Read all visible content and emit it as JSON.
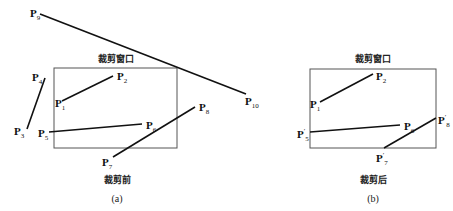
{
  "panels": [
    {
      "id": "a",
      "window_label": "裁剪窗口",
      "state_label": "裁剪前",
      "caption": "(a)",
      "window": {
        "x1": 54,
        "y1": 68,
        "x2": 177,
        "y2": 148
      },
      "segments": [
        {
          "from": "P1",
          "to": "P2",
          "x1": 62,
          "y1": 101,
          "x2": 113,
          "y2": 76
        },
        {
          "from": "P3",
          "to": "P4",
          "x1": 27,
          "y1": 129,
          "x2": 45,
          "y2": 78
        },
        {
          "from": "P5",
          "to": "P6",
          "x1": 49,
          "y1": 132,
          "x2": 142,
          "y2": 124
        },
        {
          "from": "P7",
          "to": "P8",
          "x1": 113,
          "y1": 157,
          "x2": 195,
          "y2": 107
        },
        {
          "from": "P9",
          "to": "P10",
          "x1": 40,
          "y1": 14,
          "x2": 246,
          "y2": 94
        }
      ],
      "points": [
        {
          "base": "P",
          "sub": "1",
          "prime": "",
          "x": 55,
          "y": 98
        },
        {
          "base": "P",
          "sub": "2",
          "prime": "",
          "x": 117,
          "y": 71
        },
        {
          "base": "P",
          "sub": "3",
          "prime": "",
          "x": 14,
          "y": 126
        },
        {
          "base": "P",
          "sub": "4",
          "prime": "",
          "x": 32,
          "y": 72
        },
        {
          "base": "P",
          "sub": "5",
          "prime": "",
          "x": 38,
          "y": 128
        },
        {
          "base": "P",
          "sub": "6",
          "prime": "",
          "x": 146,
          "y": 120
        },
        {
          "base": "P",
          "sub": "7",
          "prime": "",
          "x": 102,
          "y": 157
        },
        {
          "base": "P",
          "sub": "8",
          "prime": "",
          "x": 199,
          "y": 102
        },
        {
          "base": "P",
          "sub": "9",
          "prime": "",
          "x": 30,
          "y": 8
        },
        {
          "base": "P",
          "sub": "10",
          "prime": "",
          "x": 245,
          "y": 96
        }
      ],
      "window_label_pos": {
        "x": 116,
        "y": 52
      },
      "state_label_pos": {
        "x": 117,
        "y": 173
      },
      "caption_pos": {
        "x": 117,
        "y": 193
      }
    },
    {
      "id": "b",
      "window_label": "裁剪窗口",
      "state_label": "裁剪后",
      "caption": "(b)",
      "window": {
        "x1": 310,
        "y1": 69,
        "x2": 436,
        "y2": 148
      },
      "segments": [
        {
          "from": "P1",
          "to": "P2",
          "x1": 320,
          "y1": 102,
          "x2": 373,
          "y2": 74
        },
        {
          "from": "P5'",
          "to": "P6",
          "x1": 310,
          "y1": 132,
          "x2": 400,
          "y2": 125
        },
        {
          "from": "P7'",
          "to": "P8'",
          "x1": 384,
          "y1": 148,
          "x2": 436,
          "y2": 118
        }
      ],
      "points": [
        {
          "base": "P",
          "sub": "1",
          "prime": "",
          "x": 310,
          "y": 99
        },
        {
          "base": "P",
          "sub": "2",
          "prime": "",
          "x": 376,
          "y": 71
        },
        {
          "base": "P",
          "sub": "5",
          "prime": "′",
          "x": 297,
          "y": 128
        },
        {
          "base": "P",
          "sub": "6",
          "prime": "",
          "x": 404,
          "y": 121
        },
        {
          "base": "P",
          "sub": "7",
          "prime": "′",
          "x": 376,
          "y": 152
        },
        {
          "base": "P",
          "sub": "8",
          "prime": "′",
          "x": 438,
          "y": 114
        }
      ],
      "window_label_pos": {
        "x": 373,
        "y": 52
      },
      "state_label_pos": {
        "x": 373,
        "y": 173
      },
      "caption_pos": {
        "x": 373,
        "y": 193
      }
    }
  ],
  "colors": {
    "line": "#111111",
    "window": "#555555"
  }
}
